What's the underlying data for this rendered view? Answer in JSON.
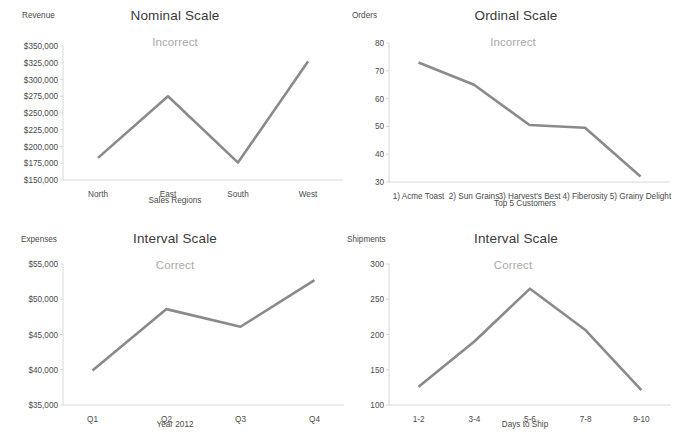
{
  "page": {
    "background": "#ffffff",
    "line_color": "#8a8a8a",
    "axis_color": "#d8d8d8",
    "title_color": "#3a3a3a",
    "annotation_color": "#a9a9a9",
    "tick_color": "#4a4a4a"
  },
  "chart_data": [
    {
      "id": "nominal-scale",
      "type": "line",
      "title": "Nominal Scale",
      "annotation": "Incorrect",
      "xlabel": "Sales Regions",
      "ylabel": "Revenue",
      "categories": [
        "North",
        "East",
        "South",
        "West"
      ],
      "values": [
        183000,
        275000,
        176000,
        327000
      ],
      "yticks": [
        "$350,000",
        "$325,000",
        "$300,000",
        "$275,000",
        "$250,000",
        "$225,000",
        "$200,000",
        "$175,000",
        "$150,000"
      ],
      "ylim": [
        150000,
        350000
      ],
      "ytick_step": 25000,
      "grid": false,
      "legend": "none"
    },
    {
      "id": "ordinal-scale",
      "type": "line",
      "title": "Ordinal Scale",
      "annotation": "Incorrect",
      "xlabel": "Top 5 Customers",
      "ylabel": "Orders",
      "categories": [
        "1) Acme Toast",
        "2) Sun Grains",
        "3) Harvest's Best",
        "4) Fiberosity",
        "5) Grainy Delight"
      ],
      "values": [
        73,
        65,
        50.5,
        49.5,
        32
      ],
      "yticks": [
        "80",
        "70",
        "60",
        "50",
        "40",
        "30"
      ],
      "ylim": [
        30,
        80
      ],
      "ytick_step": 10,
      "grid": false,
      "legend": "none"
    },
    {
      "id": "interval-scale-expenses",
      "type": "line",
      "title": "Interval Scale",
      "annotation": "Correct",
      "xlabel": "Year 2012",
      "ylabel": "Expenses",
      "categories": [
        "Q1",
        "Q2",
        "Q3",
        "Q4"
      ],
      "values": [
        39900,
        48600,
        46100,
        52700
      ],
      "yticks": [
        "$55,000",
        "$50,000",
        "$45,000",
        "$40,000",
        "$35,000"
      ],
      "ylim": [
        35000,
        55000
      ],
      "ytick_step": 5000,
      "grid": false,
      "legend": "none"
    },
    {
      "id": "interval-scale-shipments",
      "type": "line",
      "title": "Interval Scale",
      "annotation": "Correct",
      "xlabel": "Days to Ship",
      "ylabel": "Shipments",
      "categories": [
        "1-2",
        "3-4",
        "5-6",
        "7-8",
        "9-10"
      ],
      "values": [
        126,
        190,
        265,
        206,
        121
      ],
      "yticks": [
        "300",
        "250",
        "200",
        "150",
        "100"
      ],
      "ylim": [
        100,
        300
      ],
      "ytick_step": 50,
      "grid": false,
      "legend": "none"
    }
  ]
}
